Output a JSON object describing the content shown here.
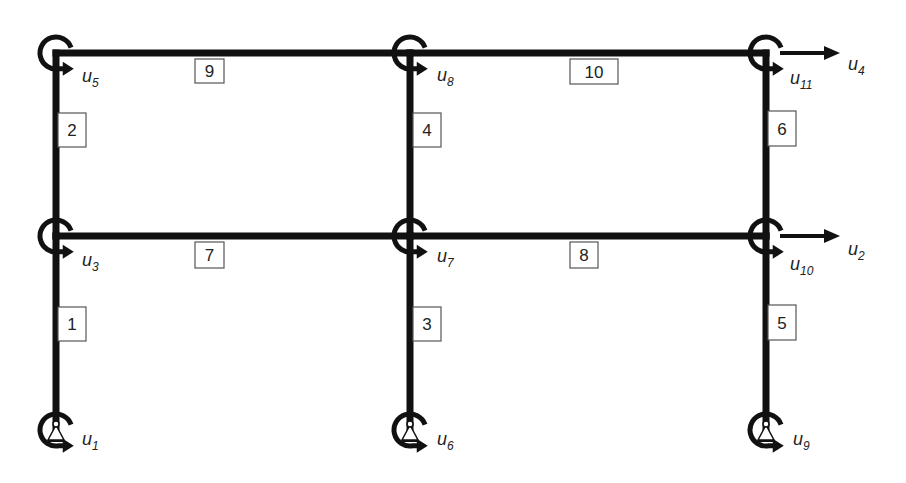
{
  "diagram": {
    "type": "plane-frame-dof",
    "colors": {
      "stroke": "#111111",
      "box_border": "#555555",
      "background": "#ffffff"
    },
    "columns_x": [
      56,
      410,
      766
    ],
    "levels_y": [
      430,
      236,
      53
    ],
    "nodes": [
      {
        "id": "base-left",
        "x": 56,
        "y": 430,
        "support": "pin",
        "rotation_dof": "1"
      },
      {
        "id": "base-mid",
        "x": 410,
        "y": 430,
        "support": "pin",
        "rotation_dof": "6"
      },
      {
        "id": "base-right",
        "x": 766,
        "y": 430,
        "support": "pin",
        "rotation_dof": "9"
      },
      {
        "id": "floor1-left",
        "x": 56,
        "y": 236,
        "rotation_dof": "3"
      },
      {
        "id": "floor1-mid",
        "x": 410,
        "y": 236,
        "rotation_dof": "7"
      },
      {
        "id": "floor1-right",
        "x": 766,
        "y": 236,
        "rotation_dof": "10",
        "translation_dof": "2"
      },
      {
        "id": "roof-left",
        "x": 56,
        "y": 53,
        "rotation_dof": "5"
      },
      {
        "id": "roof-mid",
        "x": 410,
        "y": 53,
        "rotation_dof": "8"
      },
      {
        "id": "roof-right",
        "x": 766,
        "y": 53,
        "rotation_dof": "11",
        "translation_dof": "4"
      }
    ],
    "members": [
      {
        "number": "1",
        "kind": "column",
        "from": "base-left",
        "to": "floor1-left",
        "box": {
          "x": 58,
          "y": 307,
          "w": 28,
          "h": 34
        }
      },
      {
        "number": "2",
        "kind": "column",
        "from": "floor1-left",
        "to": "roof-left",
        "box": {
          "x": 58,
          "y": 113,
          "w": 28,
          "h": 34
        }
      },
      {
        "number": "3",
        "kind": "column",
        "from": "base-mid",
        "to": "floor1-mid",
        "box": {
          "x": 413,
          "y": 307,
          "w": 28,
          "h": 34
        }
      },
      {
        "number": "4",
        "kind": "column",
        "from": "floor1-mid",
        "to": "roof-mid",
        "box": {
          "x": 413,
          "y": 113,
          "w": 28,
          "h": 34
        }
      },
      {
        "number": "5",
        "kind": "column",
        "from": "base-right",
        "to": "floor1-right",
        "box": {
          "x": 768,
          "y": 305,
          "w": 28,
          "h": 35
        }
      },
      {
        "number": "6",
        "kind": "column",
        "from": "floor1-right",
        "to": "roof-right",
        "box": {
          "x": 768,
          "y": 111,
          "w": 28,
          "h": 35
        }
      },
      {
        "number": "7",
        "kind": "beam",
        "from": "floor1-left",
        "to": "floor1-mid",
        "box": {
          "x": 195,
          "y": 242,
          "w": 29,
          "h": 26
        }
      },
      {
        "number": "8",
        "kind": "beam",
        "from": "floor1-mid",
        "to": "floor1-right",
        "box": {
          "x": 570,
          "y": 242,
          "w": 28,
          "h": 26
        }
      },
      {
        "number": "9",
        "kind": "beam",
        "from": "roof-left",
        "to": "roof-mid",
        "box": {
          "x": 195,
          "y": 59,
          "w": 29,
          "h": 24
        }
      },
      {
        "number": "10",
        "kind": "beam",
        "from": "roof-mid",
        "to": "roof-right",
        "box": {
          "x": 570,
          "y": 59,
          "w": 48,
          "h": 25
        }
      }
    ],
    "dof_labels": [
      {
        "base": "u",
        "sub": "1",
        "x": 82,
        "y": 445
      },
      {
        "base": "u",
        "sub": "6",
        "x": 437,
        "y": 445
      },
      {
        "base": "u",
        "sub": "9",
        "x": 793,
        "y": 445
      },
      {
        "base": "u",
        "sub": "3",
        "x": 82,
        "y": 266
      },
      {
        "base": "u",
        "sub": "7",
        "x": 437,
        "y": 262
      },
      {
        "base": "u",
        "sub": "10",
        "x": 790,
        "y": 270
      },
      {
        "base": "u",
        "sub": "5",
        "x": 82,
        "y": 82
      },
      {
        "base": "u",
        "sub": "8",
        "x": 437,
        "y": 81
      },
      {
        "base": "u",
        "sub": "11",
        "x": 790,
        "y": 84
      },
      {
        "base": "u",
        "sub": "2",
        "x": 848,
        "y": 255
      },
      {
        "base": "u",
        "sub": "4",
        "x": 848,
        "y": 70
      }
    ]
  }
}
